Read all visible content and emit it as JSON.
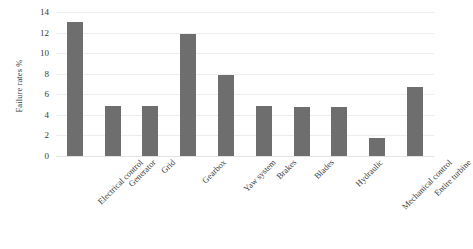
{
  "chart_data": {
    "type": "bar",
    "title": "",
    "xlabel": "",
    "ylabel": "Failure rates %",
    "categories": [
      "Electrical control",
      "Generator",
      "Grid",
      "Gearbox",
      "Yaw system",
      "Brakes",
      "Blades",
      "Hydraulic",
      "Mechanical control",
      "Entire turbine"
    ],
    "values": [
      13.0,
      4.9,
      4.9,
      11.9,
      7.9,
      4.85,
      4.8,
      4.75,
      1.8,
      6.75
    ],
    "ylim": [
      0,
      14
    ],
    "yticks": [
      0,
      2,
      4,
      6,
      8,
      10,
      12,
      14
    ],
    "ytick_labels": [
      "0",
      "2",
      "4",
      "6",
      "8",
      "10",
      "12",
      "14"
    ],
    "grid": true,
    "grid_axis": "y",
    "legend": false,
    "legend_position": "none",
    "bar_color": "#6e6e6e",
    "grid_color": "#ededed",
    "axis_color": "#e2e2e2",
    "text_color": "#3a3a3a",
    "background": "#ffffff",
    "xtick_rotation": -45
  }
}
